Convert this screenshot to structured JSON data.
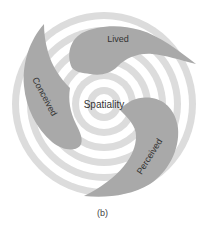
{
  "diagram": {
    "center_label": "Spatiality",
    "blades": [
      {
        "id": "lived",
        "label": "Lived"
      },
      {
        "id": "conceived",
        "label": "Conceived"
      },
      {
        "id": "perceived",
        "label": "Perceived"
      }
    ],
    "caption": "(b)",
    "colors": {
      "ring_dark": "#dcdcdc",
      "ring_light": "#ffffff",
      "blade": "#a9a9a9",
      "text": "#333333"
    }
  }
}
